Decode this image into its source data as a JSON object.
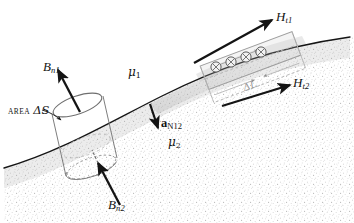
{
  "figure": {
    "type": "physics-diagram",
    "width": 354,
    "height": 223,
    "background_color": "#ffffff",
    "ink_color": "#141414",
    "faint_color": "#9a9a9a"
  },
  "regions": {
    "upper": {
      "name": "region-1",
      "permeability_label": "μ",
      "permeability_subscript": "1",
      "fill": "#ffffff",
      "texture": "plain"
    },
    "lower": {
      "name": "region-2",
      "permeability_label": "μ",
      "permeability_subscript": "2",
      "fill": "#fdfdfd",
      "texture": "stipple"
    }
  },
  "boundary": {
    "name": "interface-curve",
    "description": "curved interface separating medium 1 from medium 2"
  },
  "pillbox": {
    "name": "gaussian-pillbox",
    "area_label_caps": "AREA",
    "area_label_symbol": "ΔS",
    "normal_flux_top": {
      "symbol": "B",
      "subscript": "n1"
    },
    "normal_flux_bottom": {
      "symbol": "B",
      "subscript": "n2"
    }
  },
  "normal_vector": {
    "name": "unit-normal-a-n12",
    "symbol": "a",
    "subscript": "N12"
  },
  "amperian_loop": {
    "name": "amperian-loop",
    "path_label": "ΔL",
    "current_symbol_count": 4,
    "current_symbol": "⊗",
    "tangential_field_upper": {
      "symbol": "H",
      "subscript": "t1"
    },
    "tangential_field_lower": {
      "symbol": "H",
      "subscript": "t2"
    }
  }
}
